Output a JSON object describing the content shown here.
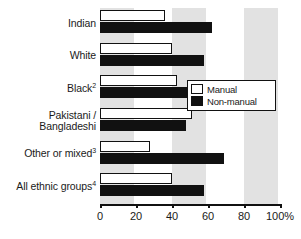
{
  "chart_data": {
    "type": "bar",
    "orientation": "horizontal",
    "title": "",
    "xlabel": "",
    "ylabel": "",
    "xlim": [
      0,
      100
    ],
    "grid": true,
    "grid_style": "alternating-vertical-bands",
    "legend_position": "upper-right-inside",
    "categories": [
      "Indian",
      "White",
      "Black",
      "Pakistani / Bangladeshi",
      "Other or mixed",
      "All ethnic groups"
    ],
    "category_labels": [
      {
        "text": "Indian",
        "footnote": ""
      },
      {
        "text": "White",
        "footnote": ""
      },
      {
        "text": "Black",
        "footnote": "2"
      },
      {
        "text": "Pakistani /\nBangladeshi",
        "footnote": ""
      },
      {
        "text": "Other or mixed",
        "footnote": "3"
      },
      {
        "text": "All ethnic groups",
        "footnote": "4"
      }
    ],
    "series": [
      {
        "name": "Manual",
        "values": [
          36,
          40,
          43,
          51,
          28,
          40
        ]
      },
      {
        "name": "Non-manual",
        "values": [
          62,
          58,
          53,
          48,
          69,
          58
        ]
      }
    ],
    "xticks": [
      0,
      20,
      40,
      60,
      80,
      100
    ],
    "xticklabels": [
      "0",
      "20",
      "40",
      "60",
      "80",
      "100%"
    ]
  },
  "legend": {
    "items": [
      {
        "label": "Manual",
        "swatch": "white-outlined"
      },
      {
        "label": "Non-manual",
        "swatch": "black-filled"
      }
    ]
  },
  "colors": {
    "bar_manual_fill": "#ffffff",
    "bar_nonmanual_fill": "#111111",
    "bar_outline": "#111111",
    "band": "#e2e2e2",
    "background": "#ffffff",
    "text": "#1a1a1a"
  }
}
